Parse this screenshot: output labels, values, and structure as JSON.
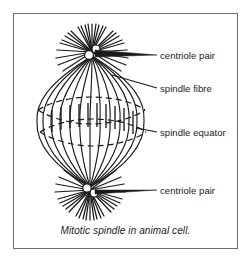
{
  "figure": {
    "caption": "Mitotic spindle in animal cell.",
    "border_color": "#6e6e6e",
    "ink_color": "#1a1a1a",
    "background": "#ffffff"
  },
  "labels": [
    {
      "id": "centriole-pair-top",
      "text": "centriole pair",
      "x": 160,
      "y": 50
    },
    {
      "id": "spindle-fibre",
      "text": "spindle fibre",
      "x": 160,
      "y": 83
    },
    {
      "id": "spindle-equator",
      "text": "spindle equator",
      "x": 160,
      "y": 127
    },
    {
      "id": "centriole-pair-bottom",
      "text": "centriole pair",
      "x": 160,
      "y": 185
    }
  ],
  "diagram": {
    "type": "biology-diagram",
    "subject": "mitotic spindle",
    "parts": [
      "centriole pair (top)",
      "aster fibres (top)",
      "spindle fibres",
      "spindle equator with chromosomes",
      "aster fibres (bottom)",
      "centriole pair (bottom)"
    ],
    "pole_top": {
      "cx": 92,
      "cy": 52
    },
    "pole_bottom": {
      "cx": 90,
      "cy": 190
    },
    "equator": {
      "cy": 121,
      "rx": 54,
      "ry": 13
    },
    "spindle_width": 108,
    "aster_ray_count": 26
  }
}
